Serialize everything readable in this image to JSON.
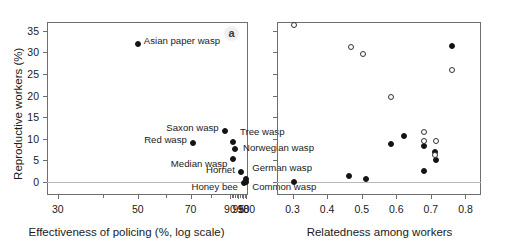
{
  "figure": {
    "panels": [
      {
        "letter": "a"
      },
      {
        "letter": "b"
      }
    ]
  },
  "chart_data": [
    {
      "type": "scatter",
      "panel": "a",
      "title": "",
      "xlabel": "Effectiveness of policing (%, log scale)",
      "ylabel": "Reproductive workers (%)",
      "xscale": "log",
      "xticks": [
        30,
        50,
        70,
        90,
        95,
        98,
        100
      ],
      "xticklabels": [
        "30",
        "50",
        "70",
        "90",
        "95",
        "98",
        "100"
      ],
      "yticks": [
        0,
        5,
        10,
        15,
        20,
        25,
        30,
        35
      ],
      "yticklabels": [
        "0",
        "5",
        "10",
        "15",
        "20",
        "25",
        "30",
        "35"
      ],
      "ylim": [
        -3,
        37
      ],
      "grid": false,
      "legend": false,
      "points": [
        {
          "label": "Asian paper wasp",
          "x": 50.0,
          "y": 32.0,
          "marker": "filled",
          "label_side": "right"
        },
        {
          "label": "Red wasp",
          "x": 71.0,
          "y": 9.0,
          "marker": "filled",
          "label_side": "left"
        },
        {
          "label": "Saxon wasp",
          "x": 87.0,
          "y": 11.7,
          "marker": "filled",
          "label_side": "left"
        },
        {
          "label": "Tree wasp",
          "x": 91.8,
          "y": 9.2,
          "marker": "filled",
          "label_side": "right"
        },
        {
          "label": "Norwegian wasp",
          "x": 93.0,
          "y": 7.7,
          "marker": "filled",
          "label_side": "right"
        },
        {
          "label": "Median wasp",
          "x": 92.0,
          "y": 5.4,
          "marker": "filled",
          "label_side": "left"
        },
        {
          "label": "Hornet",
          "x": 96.5,
          "y": 2.4,
          "marker": "filled",
          "label_side": "left"
        },
        {
          "label": "Honey bee",
          "x": 98.4,
          "y": -0.3,
          "marker": "filled",
          "label_side": "left"
        },
        {
          "label": "German wasp",
          "x": 99.9,
          "y": 0.8,
          "marker": "filled",
          "label_side": "right"
        },
        {
          "label": "Common wasp",
          "x": 99.9,
          "y": 0.0,
          "marker": "filled",
          "label_side": "right"
        }
      ]
    },
    {
      "type": "scatter",
      "panel": "b",
      "title": "",
      "xlabel": "Relatedness among workers",
      "ylabel": "",
      "xscale": "linear",
      "xticks": [
        0.3,
        0.4,
        0.5,
        0.6,
        0.7,
        0.8
      ],
      "xticklabels": [
        "0.3",
        "0.4",
        "0.5",
        "0.6",
        "0.7",
        "0.8"
      ],
      "yticks": [
        0,
        5,
        10,
        15,
        20,
        25,
        30,
        35
      ],
      "yticklabels": [
        "",
        "",
        "",
        "",
        "",
        "",
        "",
        ""
      ],
      "ylim": [
        -3,
        37
      ],
      "xlim": [
        0.255,
        0.845
      ],
      "grid": false,
      "legend": false,
      "series": [
        {
          "name": "open",
          "marker": "open",
          "points": [
            {
              "x": 0.305,
              "y": 36.2
            },
            {
              "x": 0.468,
              "y": 31.3
            },
            {
              "x": 0.505,
              "y": 29.5
            },
            {
              "x": 0.76,
              "y": 26.0
            },
            {
              "x": 0.585,
              "y": 19.7
            },
            {
              "x": 0.68,
              "y": 11.6
            },
            {
              "x": 0.68,
              "y": 9.6
            },
            {
              "x": 0.715,
              "y": 9.6
            },
            {
              "x": 0.712,
              "y": 6.3
            }
          ]
        },
        {
          "name": "filled",
          "marker": "filled",
          "points": [
            {
              "x": 0.762,
              "y": 31.5
            },
            {
              "x": 0.622,
              "y": 10.6
            },
            {
              "x": 0.584,
              "y": 8.8
            },
            {
              "x": 0.681,
              "y": 8.3
            },
            {
              "x": 0.712,
              "y": 6.9
            },
            {
              "x": 0.714,
              "y": 5.2
            },
            {
              "x": 0.679,
              "y": 2.6
            },
            {
              "x": 0.463,
              "y": 1.4
            },
            {
              "x": 0.511,
              "y": 0.8
            },
            {
              "x": 0.303,
              "y": 0.0
            }
          ]
        }
      ]
    }
  ]
}
